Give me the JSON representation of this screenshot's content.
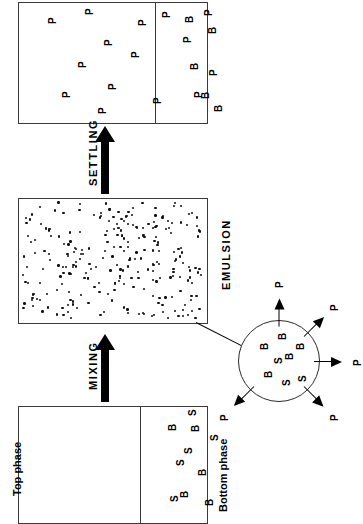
{
  "diagram": {
    "orientation": "rotated-90-ccw",
    "colors": {
      "ink": "#000000",
      "outline": "#3a3a3a",
      "background": "#ffffff"
    }
  },
  "process_labels": {
    "settling": "SETTLING",
    "mixing": "MIXING",
    "emulsion": "EMULSION"
  },
  "phase_labels": {
    "top_phase": "Top phase",
    "bottom_phase": "Bottom phase"
  },
  "species": {
    "product": "P",
    "biomass": "B",
    "salt": "S"
  },
  "vessel_settled": {
    "name": "settled vessel",
    "top_phase_glyphs": [
      {
        "label": "P",
        "x": 30,
        "y": 22
      },
      {
        "label": "P",
        "x": 44,
        "y": 96
      },
      {
        "label": "P",
        "x": 60,
        "y": 66
      },
      {
        "label": "P",
        "x": 67,
        "y": 13
      },
      {
        "label": "P",
        "x": 80,
        "y": 112
      },
      {
        "label": "P",
        "x": 86,
        "y": 44
      },
      {
        "label": "P",
        "x": 90,
        "y": 88
      },
      {
        "label": "P",
        "x": 113,
        "y": 56
      },
      {
        "label": "P",
        "x": 120,
        "y": 24
      },
      {
        "label": "P",
        "x": 135,
        "y": 102
      },
      {
        "label": "P",
        "x": 144,
        "y": 16
      }
    ],
    "bottom_phase_glyphs": [
      {
        "label": "P",
        "x": 165,
        "y": 41
      },
      {
        "label": "B",
        "x": 167,
        "y": 21
      },
      {
        "label": "B",
        "x": 172,
        "y": 68
      },
      {
        "label": "P",
        "x": 176,
        "y": 96
      },
      {
        "label": "B",
        "x": 183,
        "y": 97
      },
      {
        "label": "P",
        "x": 186,
        "y": 14
      },
      {
        "label": "B",
        "x": 190,
        "y": 32
      },
      {
        "label": "P",
        "x": 191,
        "y": 74
      },
      {
        "label": "B",
        "x": 196,
        "y": 110
      }
    ]
  },
  "vessel_emulsion": {
    "name": "emulsion vessel",
    "fill": "dense droplet dispersion",
    "dot_count": 260
  },
  "vessel_phases": {
    "name": "two-phase vessel",
    "bottom_phase_glyphs": [
      {
        "label": "B",
        "x": 150,
        "y": 25
      },
      {
        "label": "S",
        "x": 152,
        "y": 96
      },
      {
        "label": "S",
        "x": 158,
        "y": 60
      },
      {
        "label": "B",
        "x": 162,
        "y": 92
      },
      {
        "label": "S",
        "x": 166,
        "y": 48
      },
      {
        "label": "S",
        "x": 170,
        "y": 10
      },
      {
        "label": "B",
        "x": 173,
        "y": 26
      },
      {
        "label": "B",
        "x": 180,
        "y": 70
      },
      {
        "label": "B",
        "x": 187,
        "y": 100
      },
      {
        "label": "S",
        "x": 192,
        "y": 35
      }
    ]
  },
  "droplet": {
    "name": "emulsion droplet detail",
    "inner_glyphs": [
      {
        "label": "B",
        "x": 22,
        "y": 30
      },
      {
        "label": "B",
        "x": 26,
        "y": 58
      },
      {
        "label": "S",
        "x": 36,
        "y": 44
      },
      {
        "label": "B",
        "x": 40,
        "y": 20
      },
      {
        "label": "S",
        "x": 44,
        "y": 66
      },
      {
        "label": "B",
        "x": 47,
        "y": 40
      },
      {
        "label": "B",
        "x": 58,
        "y": 30
      },
      {
        "label": "S",
        "x": 60,
        "y": 62
      }
    ],
    "flux_arrows": [
      {
        "label": "P",
        "angle": -90
      },
      {
        "label": "P",
        "angle": -45
      },
      {
        "label": "P",
        "angle": 0
      },
      {
        "label": "P",
        "angle": 45
      },
      {
        "label": "P",
        "angle": 135
      }
    ]
  }
}
